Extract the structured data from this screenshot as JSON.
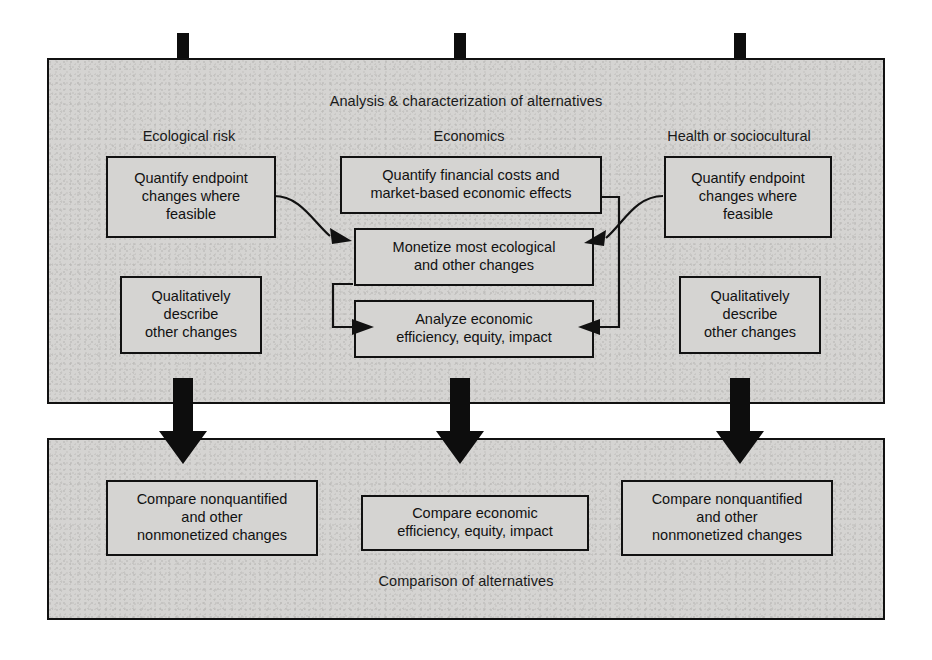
{
  "figure": {
    "title": "Analysis & characterization of alternatives",
    "background_color": "#ffffff",
    "panel_fill": "#d5d4d2",
    "line_color": "#111111"
  },
  "panels": [
    {
      "id": "analysis",
      "caption": "Analysis & characterization of alternatives"
    },
    {
      "id": "comparison",
      "caption": "Comparison of alternatives"
    }
  ],
  "columns": [
    {
      "id": "ecological",
      "heading": "Ecological risk"
    },
    {
      "id": "economics",
      "heading": "Economics"
    },
    {
      "id": "health",
      "heading": "Health or sociocultural"
    }
  ],
  "analysis_boxes": {
    "eco_quantify": {
      "line1": "Quantify endpoint",
      "line2": "changes where",
      "line3": "feasible"
    },
    "eco_qualitative": {
      "line1": "Qualitatively",
      "line2": "describe",
      "line3": "other changes"
    },
    "econ_quantify": {
      "line1": "Quantify financial costs and",
      "line2": "market-based economic effects"
    },
    "econ_monetize": {
      "line1": "Monetize most ecological",
      "line2": "and other changes"
    },
    "econ_analyze": {
      "line1": "Analyze economic",
      "line2": "efficiency, equity, impact"
    },
    "health_quantify": {
      "line1": "Quantify endpoint",
      "line2": "changes where",
      "line3": "feasible"
    },
    "health_qualitative": {
      "line1": "Qualitatively",
      "line2": "describe",
      "line3": "other changes"
    }
  },
  "comparison_boxes": {
    "left": {
      "line1": "Compare nonquantified",
      "line2": "and other",
      "line3": "nonmonetized changes"
    },
    "center": {
      "line1": "Compare economic",
      "line2": "efficiency, equity, impact"
    },
    "right": {
      "line1": "Compare nonquantified",
      "line2": "and other",
      "line3": "nonmonetized changes"
    }
  },
  "connectors": [
    {
      "id": "eco-to-monetize",
      "from": "eco_quantify",
      "to": "econ_monetize",
      "style": "curve"
    },
    {
      "id": "health-to-monetize",
      "from": "health_quantify",
      "to": "econ_monetize",
      "style": "curve"
    },
    {
      "id": "monetize-to-analyze",
      "from": "econ_monetize",
      "to": "econ_analyze",
      "style": "elbow-left"
    },
    {
      "id": "quantify-to-analyze",
      "from": "econ_quantify",
      "to": "econ_analyze",
      "style": "elbow-right"
    }
  ],
  "flow_arrows": [
    {
      "id": "arrow-left",
      "direction": "down"
    },
    {
      "id": "arrow-center",
      "direction": "down"
    },
    {
      "id": "arrow-right",
      "direction": "down"
    }
  ],
  "inlet_bars": [
    {
      "id": "inlet-left"
    },
    {
      "id": "inlet-center"
    },
    {
      "id": "inlet-right"
    }
  ]
}
